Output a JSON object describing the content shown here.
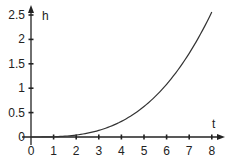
{
  "chart_data": {
    "type": "line",
    "title": "",
    "xlabel": "t",
    "ylabel": "h",
    "x_ticks": [
      "0",
      "1",
      "2",
      "3",
      "4",
      "5",
      "6",
      "7",
      "8"
    ],
    "y_ticks": [
      "0",
      "0.5",
      "1",
      "1.5",
      "2",
      "2.5"
    ],
    "xlim": [
      0,
      8
    ],
    "ylim": [
      0,
      2.5
    ],
    "grid": false,
    "legend": null,
    "series": [
      {
        "name": "h(t)",
        "x": [
          0,
          1,
          2,
          3,
          4,
          5,
          6,
          7,
          8
        ],
        "values": [
          0,
          0.005,
          0.04,
          0.135,
          0.32,
          0.625,
          1.08,
          1.715,
          2.56
        ]
      }
    ],
    "colors": {
      "axis": "#222222",
      "curve": "#333333"
    }
  }
}
